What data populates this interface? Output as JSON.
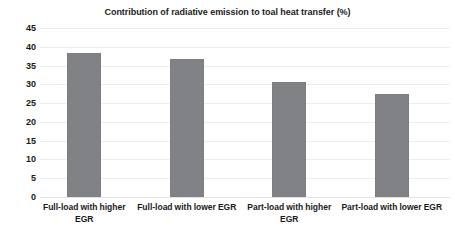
{
  "chart_data": {
    "type": "bar",
    "title": "Contribution of radiative emission to toal heat transfer (%)",
    "xlabel": "",
    "ylabel": "",
    "categories": [
      "Full-load with higher EGR",
      "Full-load with lower EGR",
      "Part-load with higher EGR",
      "Part-load with lower EGR"
    ],
    "values": [
      38.3,
      36.8,
      30.5,
      27.5
    ],
    "ylim": [
      0,
      45
    ],
    "ytick_step": 5,
    "yticks": [
      45,
      40,
      35,
      30,
      25,
      20,
      15,
      10,
      5,
      0
    ],
    "ytick_labels": [
      "45",
      "40",
      "35",
      "30",
      "25",
      "20",
      "15",
      "10",
      "5",
      "0"
    ],
    "grid": true,
    "grid_axis": "y",
    "legend": false,
    "legend_position": "none",
    "bar_color": "#808285",
    "gridline_color": "#eceded",
    "text_color": "#1a1a1a",
    "background_color": "#ffffff"
  }
}
